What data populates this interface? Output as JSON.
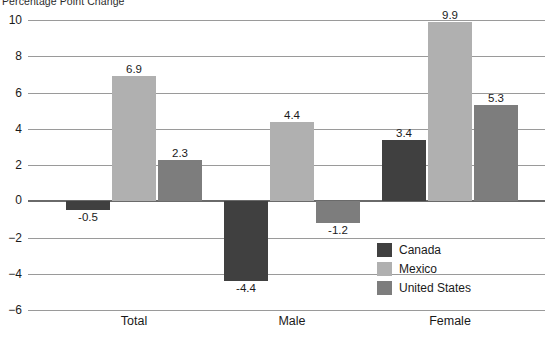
{
  "chart_data": {
    "type": "bar",
    "title": "Percentage Point Change",
    "xlabel": "",
    "ylabel": "",
    "categories": [
      "Total",
      "Male",
      "Female"
    ],
    "series": [
      {
        "name": "Canada",
        "color": "#404040",
        "values": [
          -0.5,
          -4.4,
          3.4
        ]
      },
      {
        "name": "Mexico",
        "color": "#b0b0b0",
        "values": [
          6.9,
          4.4,
          9.9
        ]
      },
      {
        "name": "United States",
        "color": "#7d7d7d",
        "values": [
          2.3,
          -1.2,
          5.3
        ]
      }
    ],
    "ylim": [
      -6,
      10
    ],
    "yticks": [
      10,
      8,
      6,
      4,
      2,
      0,
      -2,
      -4,
      -6
    ],
    "ytick_labels": [
      "10",
      "8",
      "6",
      "4",
      "2",
      "0",
      "−2",
      "−4",
      "−6"
    ],
    "value_labels": {
      "Total": [
        "-0.5",
        "6.9",
        "2.3"
      ],
      "Male": [
        "-4.4",
        "4.4",
        "-1.2"
      ],
      "Female": [
        "3.4",
        "9.9",
        "5.3"
      ]
    },
    "grid": true,
    "legend_position": "inside-lower-right",
    "legend_entries": [
      "Canada",
      "Mexico",
      "United States"
    ],
    "zero_line_emphasis": true
  },
  "colors": {
    "background": "#ffffff",
    "gridline": "#9a9a9a",
    "zero_line": "#6a6a6a",
    "text": "#1a1a1a"
  }
}
